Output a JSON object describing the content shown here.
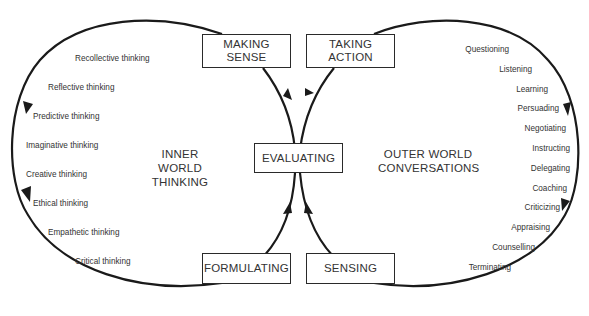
{
  "boxes": {
    "making_sense": "MAKING\nSENSE",
    "making_sense_l1": "MAKING",
    "making_sense_l2": "SENSE",
    "taking_action_l1": "TAKING",
    "taking_action_l2": "ACTION",
    "evaluating": "EVALUATING",
    "formulating": "FORMULATING",
    "sensing": "SENSING"
  },
  "left_loop": {
    "heading_l1": "INNER WORLD",
    "heading_l2": "THINKING",
    "items": [
      "Recollective thinking",
      "Reflective thinking",
      "Predictive thinking",
      "Imaginative thinking",
      "Creative thinking",
      "Ethical thinking",
      "Empathetic thinking",
      "Critical thinking"
    ]
  },
  "right_loop": {
    "heading_l1": "OUTER WORLD",
    "heading_l2": "CONVERSATIONS",
    "items": [
      "Questioning",
      "Listening",
      "Learning",
      "Persuading",
      "Negotiating",
      "Instructing",
      "Delegating",
      "Coaching",
      "Criticizing",
      "Appraising",
      "Counselling",
      "Terminating"
    ]
  },
  "colors": {
    "line": "#1a1a1a",
    "text": "#333333",
    "background": "#ffffff"
  }
}
